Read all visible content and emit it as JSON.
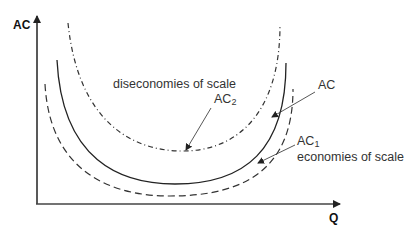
{
  "diagram": {
    "axes": {
      "y_label": "AC",
      "x_label": "Q"
    },
    "curves": [
      {
        "name": "AC",
        "style": "solid"
      },
      {
        "name": "AC1",
        "style": "dashed",
        "description": "economies of scale"
      },
      {
        "name": "AC2",
        "style": "dash-dot",
        "description": "diseconomies of scale"
      }
    ],
    "labels": {
      "ac": "AC",
      "ac1_main": "AC",
      "ac1_sub": "1",
      "ac1_desc": "economies of scale",
      "ac2_main": "AC",
      "ac2_sub": "2",
      "ac2_desc": "diseconomies of scale"
    },
    "colors": {
      "line": "#222222",
      "text": "#333333"
    }
  }
}
